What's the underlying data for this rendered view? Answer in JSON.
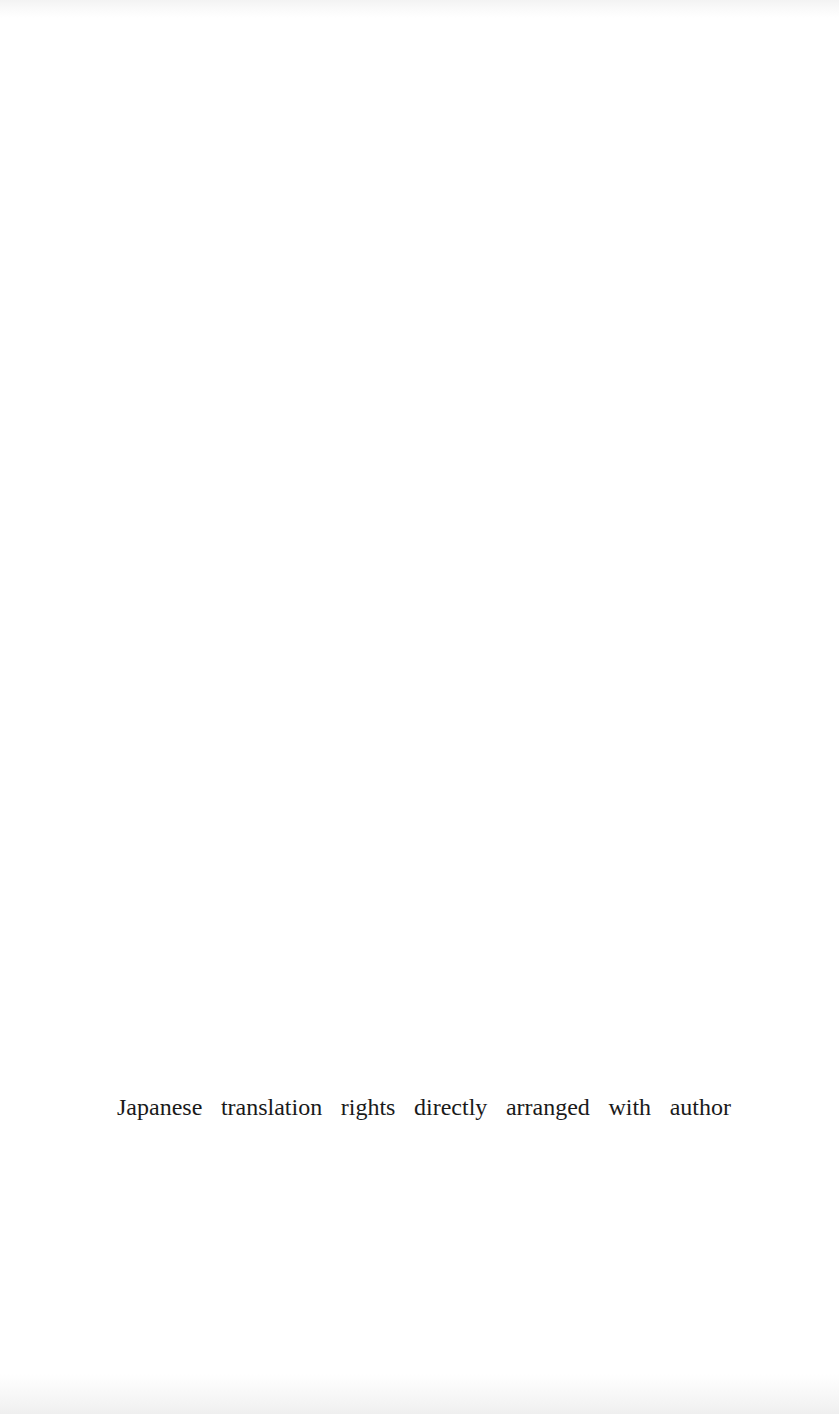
{
  "page": {
    "background": "#ffffff",
    "text_color": "#1a1a1a",
    "rights_notice": {
      "text": "Japanese translation rights directly arranged with author",
      "words": [
        "Japanese",
        "translation",
        "rights",
        "directly",
        "arranged",
        "with",
        "author"
      ]
    }
  }
}
